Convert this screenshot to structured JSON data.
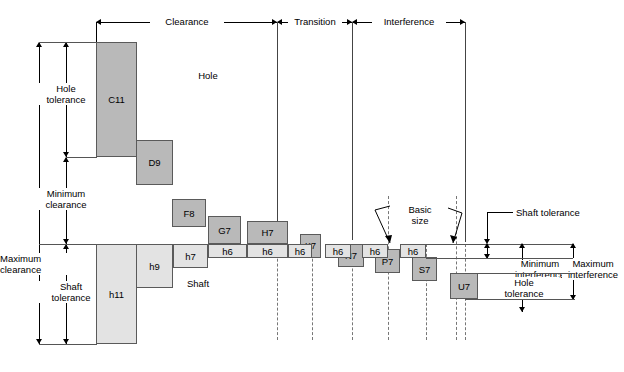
{
  "diagram": {
    "regions": [
      {
        "key": "clearance",
        "label": "Clearance",
        "x1": 96,
        "x2": 277
      },
      {
        "key": "transition",
        "label": "Transition",
        "x1": 277,
        "x2": 352
      },
      {
        "key": "interference",
        "label": "Interference",
        "x1": 352,
        "x2": 465
      }
    ],
    "area_labels": {
      "hole": "Hole",
      "shaft": "Shaft",
      "basic_size": "Basic\nsize"
    },
    "left_dimensions": [
      {
        "key": "hole-tolerance",
        "label": "Hole\ntolerance"
      },
      {
        "key": "minimum-clearance",
        "label": "Minimum\nclearance"
      },
      {
        "key": "maximum-clearance",
        "label": "Maximum\nclearance"
      },
      {
        "key": "shaft-tolerance",
        "label": "Shaft\ntolerance"
      }
    ],
    "right_dimensions": [
      {
        "key": "shaft-tolerance",
        "label": "Shaft tolerance"
      },
      {
        "key": "minimum-interference",
        "label": "Minimum\ninterference"
      },
      {
        "key": "hole-tolerance",
        "label": "Hole\ntolerance"
      },
      {
        "key": "maximum-interference",
        "label": "Maximum\ninterference"
      }
    ],
    "hole_zones": [
      {
        "key": "C11",
        "label": "C11",
        "x": 96,
        "y": 42,
        "w": 41,
        "h": 115
      },
      {
        "key": "D9",
        "label": "D9",
        "x": 136,
        "y": 140,
        "w": 37,
        "h": 45
      },
      {
        "key": "F8",
        "label": "F8",
        "x": 172,
        "y": 199,
        "w": 34,
        "h": 28
      },
      {
        "key": "G7",
        "label": "G7",
        "x": 208,
        "y": 216,
        "w": 33,
        "h": 28
      },
      {
        "key": "H7",
        "label": "H7",
        "x": 247,
        "y": 221,
        "w": 41,
        "h": 23
      },
      {
        "key": "K7",
        "label": "K7",
        "x": 300,
        "y": 234,
        "w": 21,
        "h": 24
      },
      {
        "key": "N7",
        "label": "N7",
        "x": 338,
        "y": 244,
        "w": 26,
        "h": 23
      },
      {
        "key": "P7",
        "label": "P7",
        "x": 375,
        "y": 249,
        "w": 25,
        "h": 24
      },
      {
        "key": "S7",
        "label": "S7",
        "x": 412,
        "y": 257,
        "w": 25,
        "h": 24
      },
      {
        "key": "U7",
        "label": "U7",
        "x": 450,
        "y": 273,
        "w": 28,
        "h": 26
      }
    ],
    "shaft_zones": [
      {
        "key": "h11",
        "label": "h11",
        "x": 96,
        "y": 244,
        "w": 41,
        "h": 100
      },
      {
        "key": "h9",
        "label": "h9",
        "x": 136,
        "y": 244,
        "w": 37,
        "h": 44
      },
      {
        "key": "h7",
        "label": "h7",
        "x": 173,
        "y": 244,
        "w": 35,
        "h": 24
      },
      {
        "key": "h6a",
        "label": "h6",
        "x": 208,
        "y": 244,
        "w": 39,
        "h": 14
      },
      {
        "key": "h6b",
        "label": "h6",
        "x": 247,
        "y": 244,
        "w": 41,
        "h": 14
      },
      {
        "key": "h6c",
        "label": "h6",
        "x": 288,
        "y": 244,
        "w": 24,
        "h": 14
      },
      {
        "key": "h6d",
        "label": "h6",
        "x": 325,
        "y": 244,
        "w": 26,
        "h": 14
      },
      {
        "key": "h6e",
        "label": "h6",
        "x": 362,
        "y": 244,
        "w": 26,
        "h": 14
      },
      {
        "key": "h6f",
        "label": "h6",
        "x": 400,
        "y": 244,
        "w": 26,
        "h": 14
      }
    ]
  }
}
